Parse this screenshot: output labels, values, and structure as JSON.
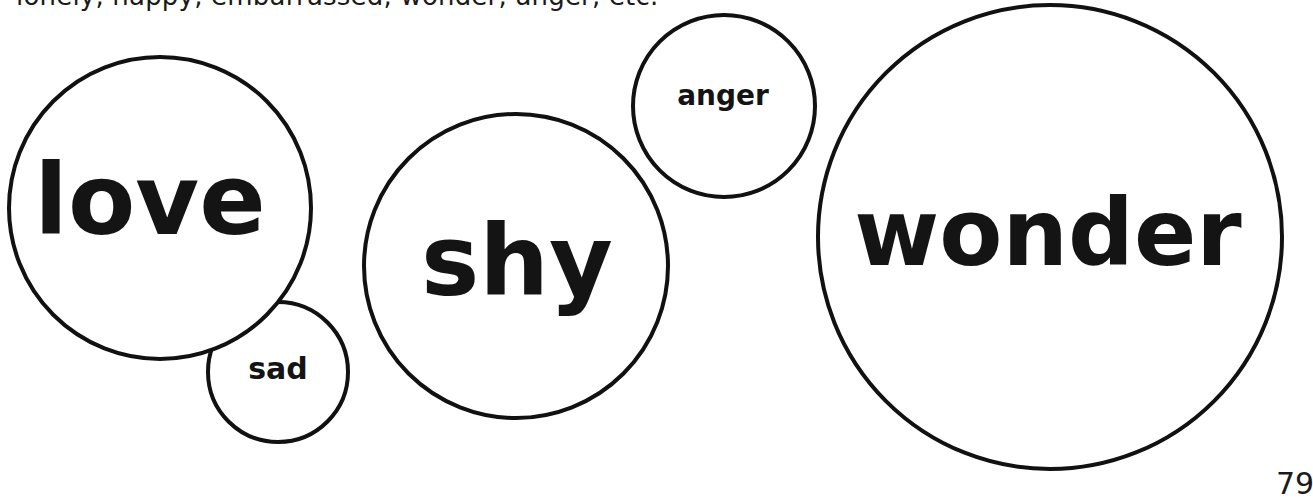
{
  "header": {
    "example_list_text": "lonely, happy, embarrassed, wonder, anger, etc."
  },
  "bubbles": [
    {
      "id": "love",
      "label": "love",
      "cx": 160,
      "cy": 208,
      "r": 151,
      "font_size": 100,
      "text_y": 234
    },
    {
      "id": "sad",
      "label": "sad",
      "cx": 278,
      "cy": 372,
      "r": 70,
      "font_size": 30,
      "text_y": 379
    },
    {
      "id": "shy",
      "label": "shy",
      "cx": 516,
      "cy": 266,
      "r": 152,
      "font_size": 100,
      "text_y": 295
    },
    {
      "id": "anger",
      "label": "anger",
      "cx": 724,
      "cy": 106,
      "r": 91,
      "font_size": 28,
      "text_y": 105
    },
    {
      "id": "wonder",
      "label": "wonder",
      "cx": 1050,
      "cy": 237,
      "r": 232,
      "font_size": 100,
      "text_y": 265
    }
  ],
  "footer": {
    "page_number": "79"
  },
  "colors": {
    "background": "#ffffff",
    "ink": "#111111"
  }
}
